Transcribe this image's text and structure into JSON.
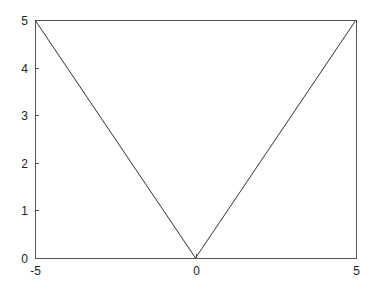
{
  "chart_data": {
    "type": "line",
    "title": "",
    "xlabel": "",
    "ylabel": "",
    "xlim": [
      -5,
      5
    ],
    "ylim": [
      0,
      5
    ],
    "grid": false,
    "legend": null,
    "x_ticks": [
      "-5",
      "0",
      "5"
    ],
    "y_ticks": [
      "0",
      "1",
      "2",
      "3",
      "4",
      "5"
    ],
    "series": [
      {
        "name": "y = |x|",
        "x": [
          -5,
          0,
          5
        ],
        "y": [
          5,
          0,
          5
        ],
        "color": "#333333"
      }
    ]
  },
  "axes_box": {
    "left": 35,
    "right": 356,
    "top": 20,
    "bottom": 258
  }
}
